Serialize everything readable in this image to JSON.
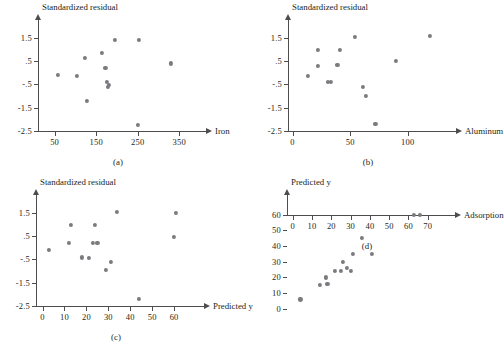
{
  "figure": {
    "background": "#ffffff",
    "point_color": "#7b7b7f",
    "axis_color": "#4d4d4f"
  },
  "panels": [
    {
      "id": "a",
      "caption": "(a)",
      "ylabel": "Standardized residual",
      "xlabel": "Iron",
      "chart_data": {
        "type": "scatter",
        "title": "",
        "xlabel": "Iron",
        "ylabel": "Standardized residual",
        "xlim": [
          10,
          395
        ],
        "ylim": [
          -2.9,
          2.1
        ],
        "xticks": [
          50,
          150,
          250,
          350
        ],
        "xticklabels": [
          "50",
          "150",
          "250",
          "350"
        ],
        "yticks": [
          1.5,
          0.5,
          -0.5,
          -1.5,
          -2.5
        ],
        "yticklabels": [
          "1.5",
          ".5",
          "-.5",
          "-1.5",
          "-2.5"
        ],
        "grid": false,
        "legend": false,
        "x": [
          58,
          103,
          122,
          128,
          163,
          172,
          175,
          178,
          180,
          196,
          252,
          250,
          330
        ],
        "y": [
          -0.1,
          -0.15,
          0.65,
          -1.2,
          0.85,
          0.2,
          -0.38,
          -0.6,
          -0.52,
          1.4,
          1.4,
          -2.25,
          0.4
        ]
      }
    },
    {
      "id": "b",
      "caption": "(b)",
      "ylabel": "Standardized residual",
      "xlabel": "Aluminum",
      "chart_data": {
        "type": "scatter",
        "title": "",
        "xlabel": "Aluminum",
        "ylabel": "Standardized residual",
        "xlim": [
          -4,
          135
        ],
        "ylim": [
          -2.9,
          2.1
        ],
        "xticks": [
          0,
          50,
          100
        ],
        "xticklabels": [
          "0",
          "50",
          "100"
        ],
        "yticks": [
          1.5,
          0.5,
          -0.5,
          -1.5,
          -2.5
        ],
        "yticklabels": [
          "1.5",
          ".5",
          "-.5",
          "-1.5",
          "-2.5"
        ],
        "grid": false,
        "legend": false,
        "x": [
          13,
          22,
          22,
          31,
          33,
          39,
          41,
          54,
          61,
          64,
          72,
          90,
          119
        ],
        "y": [
          -0.15,
          1.0,
          0.3,
          -0.4,
          -0.4,
          0.35,
          1.0,
          1.55,
          -0.62,
          -1.0,
          -2.2,
          0.5,
          1.6
        ]
      }
    },
    {
      "id": "c",
      "caption": "(c)",
      "ylabel": "Standardized residual",
      "xlabel": "Predicted y",
      "chart_data": {
        "type": "scatter",
        "title": "",
        "xlabel": "Predicted y",
        "ylabel": "Standardized residual",
        "xlim": [
          -3,
          70
        ],
        "ylim": [
          -2.9,
          2.1
        ],
        "xticks": [
          0,
          10,
          20,
          30,
          40,
          50,
          60
        ],
        "xticklabels": [
          "0",
          "10",
          "20",
          "30",
          "40",
          "50",
          "60"
        ],
        "yticks": [
          1.5,
          0.5,
          -0.5,
          -1.5,
          -2.5
        ],
        "yticklabels": [
          "1.5",
          ".5",
          "-.5",
          "-1.5",
          "-2.5"
        ],
        "grid": false,
        "legend": false,
        "x": [
          3,
          12,
          13,
          18,
          21,
          23,
          24,
          25,
          29,
          31,
          34,
          44,
          60,
          61
        ],
        "y": [
          -0.1,
          0.2,
          1.0,
          -0.42,
          -0.45,
          0.22,
          1.0,
          0.2,
          -0.95,
          -0.62,
          1.55,
          -2.2,
          0.45,
          1.5
        ]
      }
    },
    {
      "id": "d",
      "caption": "(d)",
      "ylabel": "Predicted y",
      "xlabel": "Adsorption",
      "chart_data": {
        "type": "scatter",
        "title": "",
        "xlabel": "Adsorption",
        "ylabel": "Predicted y",
        "xlim": [
          -3,
          80
        ],
        "ylim": [
          -4,
          70
        ],
        "xticks": [
          0,
          10,
          20,
          30,
          40,
          50,
          60,
          70
        ],
        "xticklabels": [
          "0",
          "10",
          "20",
          "30",
          "40",
          "50",
          "60",
          "70"
        ],
        "yticks": [
          0,
          10,
          20,
          30,
          40,
          50,
          60
        ],
        "yticklabels": [
          "0",
          "10",
          "20",
          "30",
          "40",
          "50",
          "60"
        ],
        "grid": false,
        "legend": false,
        "x": [
          4,
          14,
          17,
          18,
          22,
          25,
          26,
          28,
          30,
          31,
          36,
          41,
          63,
          66
        ],
        "y": [
          6,
          15,
          20,
          16,
          24,
          24,
          30,
          26,
          24,
          35,
          45,
          35,
          60,
          60
        ]
      }
    }
  ]
}
